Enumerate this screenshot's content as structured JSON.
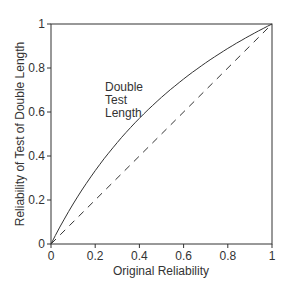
{
  "chart_data": {
    "type": "line",
    "title": "",
    "xlabel": "Original Reliability",
    "ylabel": "Reliability of Test of Double Length",
    "xlim": [
      0,
      1
    ],
    "ylim": [
      0,
      1
    ],
    "x_ticks": [
      "0",
      "0.2",
      "0.4",
      "0.6",
      "0.8",
      "1"
    ],
    "y_ticks": [
      "0",
      "0.2",
      "0.4",
      "0.6",
      "0.8",
      "1"
    ],
    "grid": false,
    "annotation": [
      "Double",
      "Test",
      "Length"
    ],
    "series": [
      {
        "name": "Double Test Length",
        "style": "solid",
        "x": [
          0,
          0.1,
          0.2,
          0.3,
          0.4,
          0.5,
          0.6,
          0.7,
          0.8,
          0.9,
          1.0
        ],
        "y": [
          0,
          0.182,
          0.333,
          0.462,
          0.571,
          0.667,
          0.75,
          0.824,
          0.889,
          0.947,
          1.0
        ]
      },
      {
        "name": "Identity",
        "style": "dashed",
        "x": [
          0,
          1
        ],
        "y": [
          0,
          1
        ]
      }
    ]
  }
}
